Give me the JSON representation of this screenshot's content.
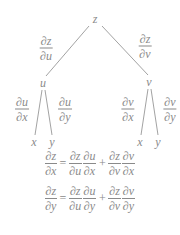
{
  "diagram": {
    "type": "chain-rule-tree",
    "root": "z",
    "intermediates": [
      "u",
      "v"
    ],
    "leaves": {
      "u": [
        "x",
        "y"
      ],
      "v": [
        "x",
        "y"
      ]
    },
    "edges": {
      "z_u": {
        "num": "∂z",
        "den": "∂u"
      },
      "z_v": {
        "num": "∂z",
        "den": "∂v"
      },
      "u_x": {
        "num": "∂u",
        "den": "∂x"
      },
      "u_y": {
        "num": "∂u",
        "den": "∂y"
      },
      "v_x": {
        "num": "∂v",
        "den": "∂x"
      },
      "v_y": {
        "num": "∂v",
        "den": "∂y"
      }
    }
  },
  "equations": [
    {
      "lhs": {
        "num": "∂z",
        "den": "∂x"
      },
      "equals": "=",
      "terms": [
        [
          {
            "num": "∂z",
            "den": "∂u"
          },
          {
            "num": "∂u",
            "den": "∂x"
          }
        ],
        [
          {
            "num": "∂z",
            "den": "∂v"
          },
          {
            "num": "∂v",
            "den": "∂x"
          }
        ]
      ],
      "plus": "+"
    },
    {
      "lhs": {
        "num": "∂z",
        "den": "∂y"
      },
      "equals": "=",
      "terms": [
        [
          {
            "num": "∂z",
            "den": "∂u"
          },
          {
            "num": "∂u",
            "den": "∂y"
          }
        ],
        [
          {
            "num": "∂z",
            "den": "∂v"
          },
          {
            "num": "∂v",
            "den": "∂y"
          }
        ]
      ],
      "plus": "+"
    }
  ],
  "colors": {
    "text": "#8a8a8a",
    "lines": "#8a8a8a",
    "background": "#ffffff"
  }
}
